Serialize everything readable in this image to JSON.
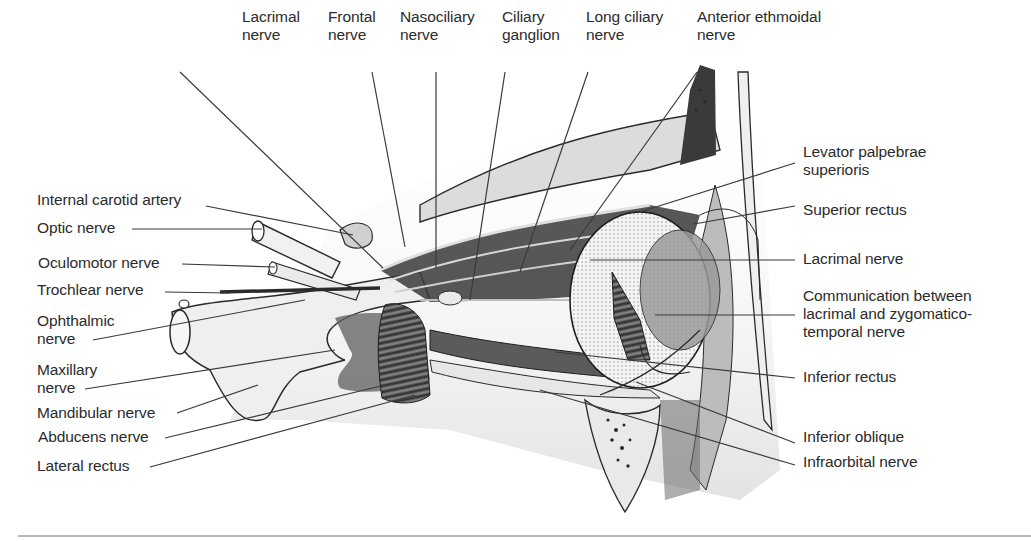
{
  "figure": {
    "type": "anatomical-diagram",
    "top_labels": [
      {
        "lines": [
          "Lacrimal",
          "nerve"
        ],
        "x": 242,
        "y": 8
      },
      {
        "lines": [
          "Frontal",
          "nerve"
        ],
        "x": 328,
        "y": 8
      },
      {
        "lines": [
          "Nasociliary",
          "nerve"
        ],
        "x": 400,
        "y": 8
      },
      {
        "lines": [
          "Ciliary",
          "ganglion"
        ],
        "x": 502,
        "y": 8
      },
      {
        "lines": [
          "Long ciliary",
          "nerve"
        ],
        "x": 586,
        "y": 8
      },
      {
        "lines": [
          "Anterior ethmoidal",
          "nerve"
        ],
        "x": 697,
        "y": 8
      }
    ],
    "left_labels": [
      {
        "lines": [
          "Internal carotid artery"
        ],
        "x": 37,
        "y": 191
      },
      {
        "lines": [
          "Optic nerve"
        ],
        "x": 37,
        "y": 219
      },
      {
        "lines": [
          "Oculomotor nerve"
        ],
        "x": 38,
        "y": 254
      },
      {
        "lines": [
          "Trochlear nerve"
        ],
        "x": 37,
        "y": 281
      },
      {
        "lines": [
          "Ophthalmic",
          "nerve"
        ],
        "x": 37,
        "y": 312
      },
      {
        "lines": [
          "Maxillary",
          "nerve"
        ],
        "x": 37,
        "y": 361
      },
      {
        "lines": [
          "Mandibular nerve"
        ],
        "x": 37,
        "y": 404
      },
      {
        "lines": [
          "Abducens nerve"
        ],
        "x": 38,
        "y": 428
      },
      {
        "lines": [
          "Lateral rectus"
        ],
        "x": 37,
        "y": 457
      }
    ],
    "right_labels": [
      {
        "lines": [
          "Levator palpebrae",
          "superioris"
        ],
        "x": 803,
        "y": 143
      },
      {
        "lines": [
          "Superior rectus"
        ],
        "x": 803,
        "y": 201
      },
      {
        "lines": [
          "Lacrimal nerve"
        ],
        "x": 803,
        "y": 250
      },
      {
        "lines": [
          "Communication between",
          "lacrimal and zygomatico-",
          "temporal nerve"
        ],
        "x": 803,
        "y": 287
      },
      {
        "lines": [
          "Inferior rectus"
        ],
        "x": 803,
        "y": 368
      },
      {
        "lines": [
          "Inferior oblique"
        ],
        "x": 803,
        "y": 428
      },
      {
        "lines": [
          "Infraorbital nerve"
        ],
        "x": 803,
        "y": 453
      }
    ],
    "leader_lines": [
      [
        180,
        72,
        383,
        268
      ],
      [
        372,
        72,
        405,
        247
      ],
      [
        436,
        72,
        436,
        268
      ],
      [
        505,
        72,
        470,
        300
      ],
      [
        588,
        72,
        520,
        272
      ],
      [
        697,
        72,
        570,
        250
      ],
      [
        206,
        206,
        353,
        235
      ],
      [
        132,
        229,
        262,
        229
      ],
      [
        182,
        264,
        275,
        267
      ],
      [
        165,
        292,
        230,
        293
      ],
      [
        93,
        340,
        305,
        300
      ],
      [
        85,
        389,
        335,
        350
      ],
      [
        177,
        413,
        258,
        385
      ],
      [
        165,
        438,
        385,
        385
      ],
      [
        150,
        467,
        415,
        395
      ],
      [
        795,
        163,
        640,
        212
      ],
      [
        795,
        206,
        694,
        224
      ],
      [
        795,
        260,
        590,
        260
      ],
      [
        795,
        315,
        655,
        315
      ],
      [
        795,
        378,
        555,
        352
      ],
      [
        795,
        443,
        636,
        382
      ],
      [
        795,
        465,
        540,
        390
      ]
    ],
    "colors": {
      "background": "#ffffff",
      "text": "#2b2b2b",
      "line": "#3a3a3a",
      "rule": "#b8b8b8"
    }
  }
}
